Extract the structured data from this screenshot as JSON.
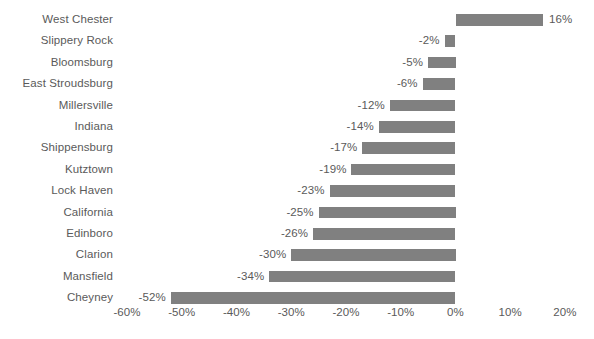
{
  "chart_data": {
    "type": "bar",
    "orientation": "horizontal",
    "title": "",
    "subtitle": "",
    "xlabel": "",
    "ylabel": "",
    "xlim": [
      -60,
      20
    ],
    "xticks": [
      -60,
      -50,
      -40,
      -30,
      -20,
      -10,
      0,
      10,
      20
    ],
    "xtick_labels": [
      "-60%",
      "-50%",
      "-40%",
      "-30%",
      "-20%",
      "-10%",
      "0%",
      "10%",
      "20%"
    ],
    "grid": false,
    "legend": null,
    "legend_position": "none",
    "value_format": "percent",
    "bar_color": "#808080",
    "text_color": "#5a5a5a",
    "background_color": "#ffffff",
    "categories": [
      "West Chester",
      "Slippery Rock",
      "Bloomsburg",
      "East Stroudsburg",
      "Millersville",
      "Indiana",
      "Shippensburg",
      "Kutztown",
      "Lock Haven",
      "California",
      "Edinboro",
      "Clarion",
      "Mansfield",
      "Cheyney"
    ],
    "values": [
      16,
      -2,
      -5,
      -6,
      -12,
      -14,
      -17,
      -19,
      -23,
      -25,
      -26,
      -30,
      -34,
      -52
    ],
    "data_labels": [
      "16%",
      "-2%",
      "-5%",
      "-6%",
      "-12%",
      "-14%",
      "-17%",
      "-19%",
      "-23%",
      "-25%",
      "-26%",
      "-30%",
      "-34%",
      "-52%"
    ]
  }
}
